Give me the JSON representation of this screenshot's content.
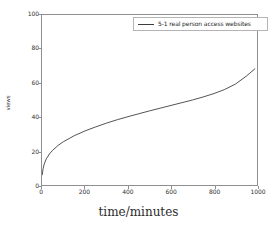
{
  "chart_data": {
    "type": "line",
    "title": "",
    "xlabel": "time/minutes",
    "ylabel": "views",
    "xlim": [
      0,
      1000
    ],
    "ylim": [
      0,
      100
    ],
    "xticks": [
      0,
      200,
      400,
      600,
      800,
      1000
    ],
    "yticks": [
      0,
      20,
      40,
      60,
      80,
      100
    ],
    "grid": false,
    "legend_position": "upper right",
    "series": [
      {
        "name": "5-1 real person access websites",
        "color": "#3d3d3d",
        "x": [
          1,
          5,
          10,
          20,
          35,
          50,
          75,
          100,
          150,
          200,
          250,
          300,
          350,
          400,
          450,
          500,
          550,
          600,
          650,
          700,
          750,
          800,
          850,
          900,
          950,
          990
        ],
        "values": [
          6.0,
          9.5,
          12.2,
          15.4,
          18.3,
          20.5,
          23.3,
          25.5,
          29.0,
          31.8,
          34.2,
          36.4,
          38.4,
          40.2,
          41.9,
          43.6,
          45.2,
          46.8,
          48.4,
          50.0,
          51.8,
          53.8,
          56.2,
          59.4,
          64.0,
          68.3
        ]
      }
    ]
  },
  "legend": {
    "entries": [
      {
        "label": "5-1 real person access websites",
        "marker": "line-swatch"
      }
    ]
  },
  "axes": {
    "x_tick_labels": [
      "0",
      "200",
      "400",
      "600",
      "800",
      "1000"
    ],
    "y_tick_labels": [
      "0",
      "20",
      "40",
      "60",
      "80",
      "100"
    ],
    "x_title": "time/minutes",
    "y_title": "views"
  },
  "colors": {
    "line": "#3d3d3d",
    "axis": "#8f8f8f",
    "text": "#303030",
    "background": "#ffffff",
    "legend_border": "#b4b4b4"
  }
}
